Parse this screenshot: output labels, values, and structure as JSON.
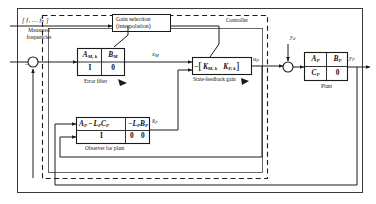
{
  "figure": {
    "title_region": "control-block-diagram",
    "outer_border": true,
    "controller_boundary_label": "Controller",
    "plant_label": "Plant"
  },
  "inputs": {
    "frequencies_symbol": "[ f₁ … fₙ ]",
    "frequencies_caption_line1": "Measured",
    "frequencies_caption_line2": "frequencies",
    "disturbance_symbol": "y",
    "disturbance_subscript": "d"
  },
  "blocks": [
    {
      "id": "gain-selection",
      "line1": "Gain selection",
      "line2": "(interpolation)"
    },
    {
      "id": "error-filter",
      "caption": "Error filter",
      "matrix": {
        "top_left": "A",
        "top_left_sub": "M, k",
        "top_right": "B",
        "top_right_sub": "M",
        "bottom_left": "I",
        "bottom_right": "0"
      }
    },
    {
      "id": "state-feedback-gain",
      "caption": "State-feedback gain",
      "sign": "−",
      "bracket_open": "[",
      "bracket_close": "]",
      "gain1": "K",
      "gain1_sub": "M, k",
      "gain2": "K",
      "gain2_sub": "P, k"
    },
    {
      "id": "observer-for-plant",
      "caption": "Observer for plant",
      "matrix": {
        "top_left_a": "A",
        "top_left_a_sub": "P",
        "top_left_minus": "−",
        "top_left_l": "L",
        "top_left_l_sub": "P",
        "top_left_c": "C",
        "top_left_c_sub": "P",
        "top_mid_minus_l": "−L",
        "top_mid_sub": "P",
        "top_right_b": "B",
        "top_right_sub": "P",
        "bottom_left": "I",
        "bottom_mid": "0",
        "bottom_right": "0"
      }
    },
    {
      "id": "plant",
      "caption": "Plant",
      "matrix": {
        "top_left": "A",
        "top_left_sub": "P",
        "top_right": "B",
        "top_right_sub": "P",
        "bottom_left": "C",
        "bottom_left_sub": "P",
        "bottom_right": "0"
      }
    }
  ],
  "signals": {
    "x_m": "x",
    "x_m_sub": "M",
    "u_p": "u",
    "u_p_sub": "P",
    "y_p": "y",
    "y_p_sub": "P",
    "x_hat_p": "x̂",
    "x_hat_p_sub": "P",
    "summing_minus": "−"
  },
  "colors": {
    "line": "#1a1a1a",
    "background": "#ffffff",
    "text": "#111111"
  }
}
